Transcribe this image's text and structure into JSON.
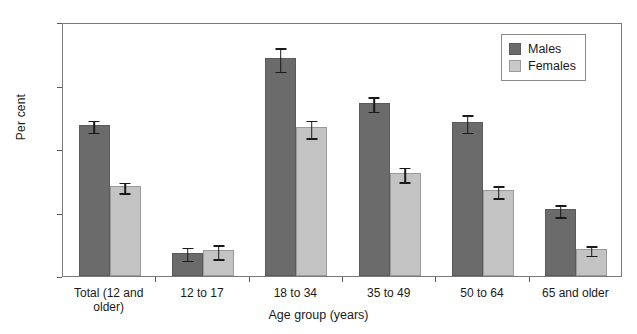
{
  "chart_data": {
    "type": "bar",
    "title": "",
    "xlabel": "Age group (years)",
    "ylabel": "Per cent",
    "categories": [
      "Total (12 and\nolder)",
      "12 to 17",
      "18 to 34",
      "35 to 49",
      "50 to 64",
      "65 and older"
    ],
    "ylim": [
      0,
      40
    ],
    "yticks": [
      0,
      10,
      20,
      30,
      40
    ],
    "ytick_labels": [
      "0",
      "10",
      "20",
      "30",
      "40"
    ],
    "grid": false,
    "legend_position": "top-right",
    "series": [
      {
        "name": "Males",
        "color": "#6b6b6b",
        "values": [
          23.8,
          3.6,
          34.3,
          27.3,
          24.2,
          10.5
        ],
        "error_low": [
          22.9,
          2.7,
          32.5,
          26.2,
          22.9,
          9.6
        ],
        "error_high": [
          24.8,
          4.8,
          36.2,
          28.5,
          25.6,
          11.5
        ]
      },
      {
        "name": "Females",
        "color": "#c3c3c3",
        "values": [
          14.2,
          4.1,
          23.4,
          16.2,
          13.5,
          4.2
        ],
        "error_low": [
          13.4,
          3.0,
          22.0,
          15.1,
          12.6,
          3.5
        ],
        "error_high": [
          15.0,
          5.2,
          24.8,
          17.4,
          14.5,
          5.0
        ]
      }
    ]
  },
  "legend": {
    "items": [
      {
        "label": "Males",
        "swatch": "male-swatch"
      },
      {
        "label": "Females",
        "swatch": "female-swatch"
      }
    ]
  }
}
